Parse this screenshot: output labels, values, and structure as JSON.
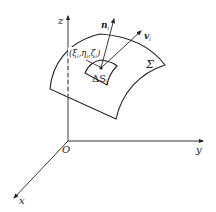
{
  "diagram": {
    "type": "3d-surface-element-illustration",
    "axes": {
      "z_label": "z",
      "y_label": "y",
      "x_label": "x",
      "origin_label": "O"
    },
    "surface_label": "Σ",
    "point_label": "(ξ",
    "point_label_full": "(ξi,ηi,ζi)",
    "point": {
      "xi": "ξ",
      "eta": "η",
      "zeta": "ζ",
      "sub": "i"
    },
    "element_label": "ΔS",
    "element_sub": "i",
    "normal_label": "n",
    "normal_sub": "i",
    "velocity_label": "v",
    "velocity_sub": "i",
    "colors": {
      "line": "#222222",
      "background": "#ffffff"
    }
  }
}
